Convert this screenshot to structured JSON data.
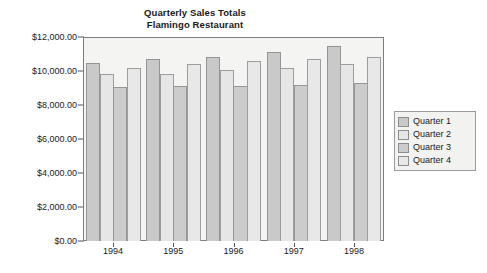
{
  "chart_data": {
    "type": "bar",
    "title": "Quarterly Sales Totals",
    "subtitle": "Flamingo Restaurant",
    "title_line1": "Quarterly Sales Totals",
    "title_line2": "Flamingo Restaurant",
    "xlabel": "",
    "ylabel": "",
    "ylim": [
      0,
      12000
    ],
    "grid": false,
    "legend_position": "right",
    "categories": [
      "1994",
      "1995",
      "1996",
      "1997",
      "1998"
    ],
    "ytick_labels": [
      "$0.00",
      "$2,000.00",
      "$4,000.00",
      "$6,000.00",
      "$8,000.00",
      "$10,000.00",
      "$12,000.00"
    ],
    "ytick_values": [
      0,
      2000,
      4000,
      6000,
      8000,
      10000,
      12000
    ],
    "series": [
      {
        "name": "Quarter 1",
        "color": "#c9c9c9",
        "values": [
          10500,
          10700,
          10850,
          11100,
          11500
        ]
      },
      {
        "name": "Quarter 2",
        "color": "#e6e6e6",
        "values": [
          9800,
          9850,
          10050,
          10200,
          10400
        ]
      },
      {
        "name": "Quarter 3",
        "color": "#cccccc",
        "values": [
          9050,
          9100,
          9100,
          9150,
          9300
        ]
      },
      {
        "name": "Quarter 4",
        "color": "#e8e8e8",
        "values": [
          10150,
          10400,
          10600,
          10700,
          10850
        ]
      }
    ]
  },
  "legend": {
    "items": [
      {
        "label": "Quarter 1"
      },
      {
        "label": "Quarter 2"
      },
      {
        "label": "Quarter 3"
      },
      {
        "label": "Quarter 4"
      }
    ]
  }
}
